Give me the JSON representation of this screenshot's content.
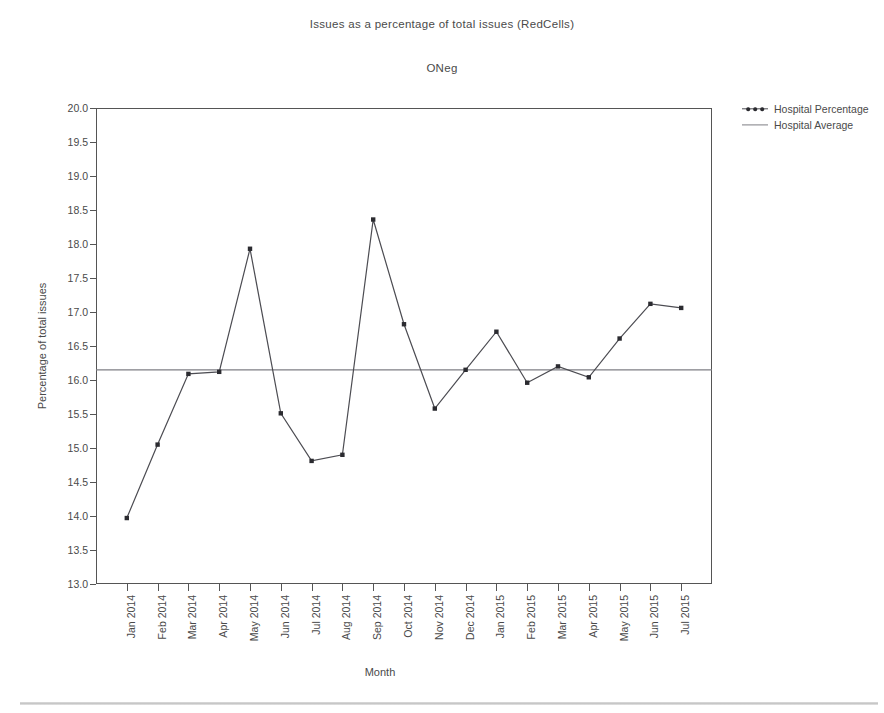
{
  "chart_data": {
    "type": "line",
    "title": "Issues as a percentage of total issues (RedCells)",
    "subtitle": "ONeg",
    "xlabel": "Month",
    "ylabel": "Percentage of total issues",
    "ylim": [
      13.0,
      20.0
    ],
    "ytick_labels": [
      "20.0",
      "19.5",
      "19.0",
      "18.5",
      "18.0",
      "17.5",
      "17.0",
      "16.5",
      "16.0",
      "15.5",
      "15.0",
      "14.5",
      "14.0",
      "13.5",
      "13.0"
    ],
    "yticks": [
      20.0,
      19.5,
      19.0,
      18.5,
      18.0,
      17.5,
      17.0,
      16.5,
      16.0,
      15.5,
      15.0,
      14.5,
      14.0,
      13.5,
      13.0
    ],
    "grid": false,
    "legend_position": "right",
    "categories": [
      "Jan 2014",
      "Feb 2014",
      "Mar 2014",
      "Apr 2014",
      "May 2014",
      "Jun 2014",
      "Jul 2014",
      "Aug 2014",
      "Sep 2014",
      "Oct 2014",
      "Nov 2014",
      "Dec 2014",
      "Jan 2015",
      "Feb 2015",
      "Mar 2015",
      "Apr 2015",
      "May 2015",
      "Jun 2015",
      "Jul 2015"
    ],
    "series": [
      {
        "name": "Hospital Percentage",
        "style": "line-markers",
        "color": "#4c4c52",
        "values": [
          13.97,
          15.05,
          16.09,
          16.12,
          17.93,
          15.51,
          14.81,
          14.9,
          18.36,
          16.82,
          15.58,
          16.15,
          16.71,
          15.96,
          16.2,
          16.04,
          16.61,
          17.12,
          17.06
        ]
      },
      {
        "name": "Hospital Average",
        "style": "horizontal-line",
        "color": "#7e7e84",
        "value": 16.15
      }
    ]
  },
  "legend": {
    "items": [
      {
        "label": "Hospital Percentage"
      },
      {
        "label": "Hospital Average"
      }
    ]
  }
}
